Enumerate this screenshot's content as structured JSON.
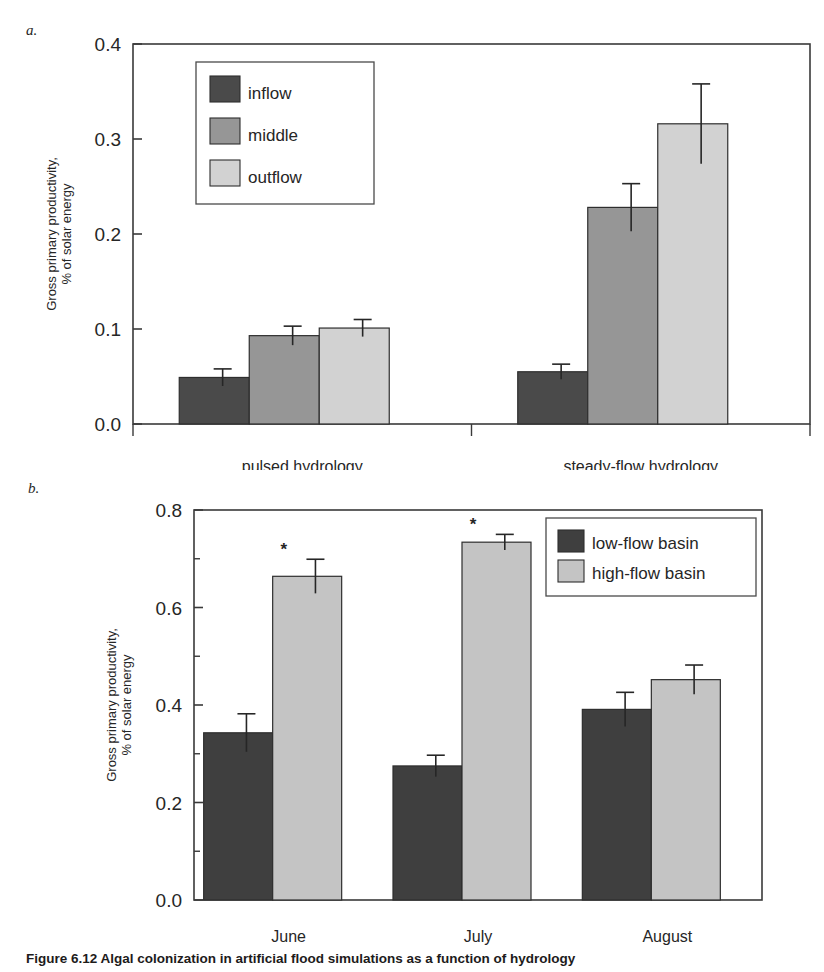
{
  "figure": {
    "panel_a_letter": "a.",
    "panel_b_letter": "b.",
    "caption": "Figure 6.12  Algal colonization in artificial flood simulations as a function of hydrology"
  },
  "chart_data": [
    {
      "id": "panel-a",
      "type": "bar",
      "title": "",
      "xlabel": "",
      "ylabel": "Gross primary productivity,\n% of solar energy",
      "ylabel_line1": "Gross primary productivity,",
      "ylabel_line2": "% of solar energy",
      "ylim": [
        0.0,
        0.4
      ],
      "ytick_values": [
        0.0,
        0.1,
        0.2,
        0.3,
        0.4
      ],
      "ytick_labels": [
        "0.0",
        "0.1",
        "0.2",
        "0.3",
        "0.4"
      ],
      "minor_ticks": false,
      "grid": false,
      "legend_position": "upper-left-inside",
      "categories": [
        "pulsed hydrology",
        "steady-flow hydrology"
      ],
      "series": [
        {
          "name": "inflow",
          "color": "#4a4a4a",
          "values": [
            0.049,
            0.055
          ],
          "errors": [
            0.009,
            0.008
          ]
        },
        {
          "name": "middle",
          "color": "#969696",
          "values": [
            0.093,
            0.228
          ],
          "errors": [
            0.01,
            0.025
          ]
        },
        {
          "name": "outflow",
          "color": "#d2d2d2",
          "values": [
            0.101,
            0.316
          ],
          "errors": [
            0.009,
            0.042
          ]
        }
      ],
      "annotations": []
    },
    {
      "id": "panel-b",
      "type": "bar",
      "title": "",
      "xlabel": "",
      "ylabel": "Gross primary productivity,\n% of solar energy",
      "ylabel_line1": "Gross primary productivity,",
      "ylabel_line2": "% of solar energy",
      "ylim": [
        0.0,
        0.8
      ],
      "ytick_values": [
        0.0,
        0.2,
        0.4,
        0.6,
        0.8
      ],
      "ytick_labels": [
        "0.0",
        "0.2",
        "0.4",
        "0.6",
        "0.8"
      ],
      "minor_tick_values": [
        0.1,
        0.3,
        0.5,
        0.7
      ],
      "minor_ticks": true,
      "grid": false,
      "legend_position": "upper-right-inside",
      "categories": [
        "June",
        "July",
        "August"
      ],
      "series": [
        {
          "name": "low-flow basin",
          "color": "#3f3f3f",
          "values": [
            0.343,
            0.275,
            0.391
          ],
          "errors": [
            0.039,
            0.022,
            0.035
          ]
        },
        {
          "name": "high-flow basin",
          "color": "#c4c4c4",
          "values": [
            0.664,
            0.734,
            0.452
          ],
          "errors": [
            0.035,
            0.016,
            0.03
          ]
        }
      ],
      "annotations": [
        {
          "text": "*",
          "category": "June",
          "series": "high-flow basin"
        },
        {
          "text": "*",
          "category": "July",
          "series": "high-flow basin"
        }
      ]
    }
  ]
}
